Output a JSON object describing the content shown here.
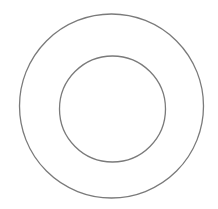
{
  "canvas": {
    "width": 218,
    "height": 209,
    "background": "#ffffff"
  },
  "shapes": [
    {
      "type": "circle",
      "name": "outer-circle",
      "cx": 111.5,
      "cy": 106,
      "r": 92,
      "stroke": "#7a7a7a",
      "stroke_width": 1.3,
      "fill": "none"
    },
    {
      "type": "circle",
      "name": "inner-circle",
      "cx": 112.5,
      "cy": 109,
      "r": 53,
      "stroke": "#7a7a7a",
      "stroke_width": 1.3,
      "fill": "none"
    }
  ]
}
